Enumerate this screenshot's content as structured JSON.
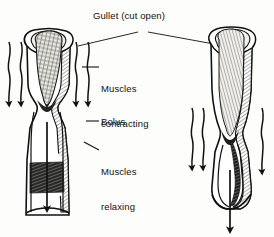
{
  "figure": {
    "background_color": "#fdfdfb",
    "ink_color": "#111111",
    "width": 274,
    "height": 237
  },
  "labels": {
    "gullet": "Gullet (cut open)",
    "muscles_contracting_line1": "Muscles",
    "muscles_contracting_line2": "contracting",
    "bolus": "Bolus",
    "muscles_relaxing_line1": "Muscles",
    "muscles_relaxing_line2": "relaxing"
  },
  "diagram_data": {
    "type": "anatomical-diagram",
    "subject": "gullet (oesophagus) peristalsis",
    "panels": [
      {
        "name": "left-tube",
        "description": "Gullet cut open showing bolus high in the tube with muscles contracting above and relaxing below",
        "cut_open_top": true,
        "bolus_present": true,
        "bolus_position": "upper",
        "constriction_y": 105,
        "features": [
          "cut-open-rim",
          "hatched-bolus",
          "constriction",
          "widened-lower-tube"
        ]
      },
      {
        "name": "right-tube",
        "description": "Gullet cut open showing bolus moved lower, constriction ring further down",
        "cut_open_top": true,
        "bolus_present": true,
        "bolus_position": "lower",
        "constriction_y": 140,
        "features": [
          "cut-open-rim",
          "hatched-lining",
          "constriction",
          "bulged-lower-tube"
        ]
      }
    ],
    "arrows": [
      {
        "name": "left-outer-left-wavy",
        "direction": "down",
        "side": "left-of-left-tube"
      },
      {
        "name": "left-inner-left-wavy",
        "direction": "down",
        "side": "left-of-left-tube"
      },
      {
        "name": "left-inner-right-wavy",
        "direction": "down",
        "side": "right-of-left-tube"
      },
      {
        "name": "left-outer-right-wavy",
        "direction": "down",
        "side": "right-of-left-tube"
      },
      {
        "name": "left-central-straight",
        "direction": "down",
        "side": "inside-left-tube"
      },
      {
        "name": "right-left-wavy",
        "direction": "down",
        "side": "left-of-right-tube"
      },
      {
        "name": "right-right-wavy",
        "direction": "down",
        "side": "right-of-right-tube"
      },
      {
        "name": "right-central-straight",
        "direction": "down",
        "side": "inside-right-tube"
      }
    ],
    "leader_lines": [
      {
        "from": "gullet-label",
        "to": "left-tube-rim"
      },
      {
        "from": "gullet-label",
        "to": "right-tube-rim"
      },
      {
        "from": "muscles-contracting-label",
        "to": "left-tube-upper-wall"
      },
      {
        "from": "bolus-label",
        "to": "left-tube-lumen"
      },
      {
        "from": "muscles-relaxing-label",
        "to": "left-tube-lower-wall"
      }
    ]
  }
}
